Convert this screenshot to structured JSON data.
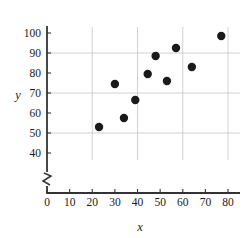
{
  "chart_data": {
    "type": "scatter",
    "title": "",
    "xlabel": "x",
    "ylabel": "y",
    "xlim": [
      0,
      80
    ],
    "ylim": [
      40,
      105
    ],
    "grid": true,
    "legend": null,
    "axis_break_y": true,
    "xticks": [
      0,
      10,
      20,
      30,
      40,
      50,
      60,
      70,
      80
    ],
    "xtick_labels": [
      "0",
      "10",
      "20",
      "30",
      "40",
      "50",
      "60",
      "70",
      "80"
    ],
    "yticks": [
      40,
      50,
      60,
      70,
      80,
      90,
      100
    ],
    "ytick_labels": [
      "40",
      "50",
      "60",
      "70",
      "80",
      "90",
      "100"
    ],
    "gridlines_x": [
      20,
      40,
      60,
      80
    ],
    "gridlines_y": [
      50,
      70,
      90
    ],
    "marker": "filled-circle",
    "marker_color": "#1a1a1a",
    "marker_size": 4.2,
    "points": [
      {
        "x": 23,
        "y": 53
      },
      {
        "x": 30,
        "y": 74.5
      },
      {
        "x": 34,
        "y": 57.5
      },
      {
        "x": 39,
        "y": 66.5
      },
      {
        "x": 44.5,
        "y": 79.5
      },
      {
        "x": 48,
        "y": 88.5
      },
      {
        "x": 53,
        "y": 76
      },
      {
        "x": 57,
        "y": 92.5
      },
      {
        "x": 64,
        "y": 83
      },
      {
        "x": 77,
        "y": 98.5
      }
    ],
    "colors": {
      "axis": "#333333",
      "grid": "#bfbfbf",
      "marker": "#1a1a1a",
      "background": "#ffffff"
    }
  }
}
